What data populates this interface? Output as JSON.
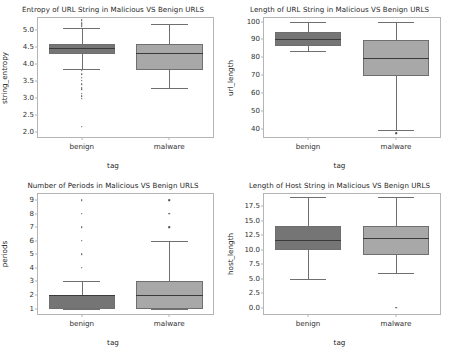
{
  "figure": {
    "background": "#ffffff",
    "benign_color": "#757575",
    "malware_color": "#a8a8a8",
    "edge_color": "#6f6f6f"
  },
  "chart_data": [
    {
      "id": "entropy",
      "type": "box",
      "title": "Entropy of URL String in Malicious VS Benign URLS",
      "xlabel": "tag",
      "ylabel": "string_entropy",
      "categories": [
        "benign",
        "malware"
      ],
      "yticks": [
        2.0,
        2.5,
        3.0,
        3.5,
        4.0,
        4.5,
        5.0
      ],
      "ytick_labels": [
        "2.0",
        "2.5",
        "3.0",
        "3.5",
        "4.0",
        "4.5",
        "5.0"
      ],
      "ylim": [
        1.85,
        5.35
      ],
      "grid": false,
      "boxes": [
        {
          "name": "benign",
          "color": "#757575",
          "whislo": 3.86,
          "q1": 4.28,
          "med": 4.46,
          "q3": 4.6,
          "whishi": 5.07,
          "fliers": [
            5.28,
            5.2,
            5.15,
            5.12,
            5.09,
            3.8,
            3.7,
            3.6,
            3.5,
            3.4,
            3.3,
            3.25,
            3.12,
            3.05,
            2.98,
            2.15
          ]
        },
        {
          "name": "malware",
          "color": "#a8a8a8",
          "whislo": 3.28,
          "q1": 3.83,
          "med": 4.32,
          "q3": 4.58,
          "whishi": 5.18,
          "fliers": []
        }
      ]
    },
    {
      "id": "url_length",
      "type": "box",
      "title": "Length of URL String in Malicious VS Benign URLS",
      "xlabel": "tag",
      "ylabel": "url_length",
      "categories": [
        "benign",
        "malware"
      ],
      "yticks": [
        40,
        50,
        60,
        70,
        80,
        90,
        100
      ],
      "ytick_labels": [
        "40",
        "50",
        "60",
        "70",
        "80",
        "90",
        "100"
      ],
      "ylim": [
        35.5,
        102
      ],
      "grid": false,
      "boxes": [
        {
          "name": "benign",
          "color": "#757575",
          "whislo": 83.5,
          "q1": 86.5,
          "med": 90.5,
          "q3": 94.0,
          "whishi": 99.5,
          "fliers": []
        },
        {
          "name": "malware",
          "color": "#a8a8a8",
          "whislo": 39.5,
          "q1": 69.8,
          "med": 79.5,
          "q3": 89.8,
          "whishi": 99.5,
          "fliers": [
            37.5
          ]
        }
      ]
    },
    {
      "id": "periods",
      "type": "box",
      "title": "Number of Periods in Malicious VS Benign URLS",
      "xlabel": "tag",
      "ylabel": "periods",
      "categories": [
        "benign",
        "malware"
      ],
      "yticks": [
        1,
        2,
        3,
        4,
        5,
        6,
        7,
        8,
        9
      ],
      "ytick_labels": [
        "1",
        "2",
        "3",
        "4",
        "5",
        "6",
        "7",
        "8",
        "9"
      ],
      "ylim": [
        0.6,
        9.45
      ],
      "grid": false,
      "boxes": [
        {
          "name": "benign",
          "color": "#757575",
          "whislo": 1.0,
          "q1": 1.0,
          "med": 2.0,
          "q3": 2.0,
          "whishi": 3.0,
          "fliers": [
            4,
            5,
            6,
            7,
            8,
            9
          ]
        },
        {
          "name": "malware",
          "color": "#a8a8a8",
          "whislo": 1.0,
          "q1": 1.0,
          "med": 2.0,
          "q3": 3.0,
          "whishi": 6.0,
          "fliers": [
            7,
            8,
            9
          ]
        }
      ]
    },
    {
      "id": "host_length",
      "type": "box",
      "title": "Length of Host String in Malicious VS Benign URLS",
      "xlabel": "tag",
      "ylabel": "host_length",
      "categories": [
        "benign",
        "malware"
      ],
      "yticks": [
        0.0,
        2.5,
        5.0,
        7.5,
        10.0,
        12.5,
        15.0,
        17.5
      ],
      "ytick_labels": [
        "0.0",
        "2.5",
        "5.0",
        "7.5",
        "10.0",
        "12.5",
        "15.0",
        "17.5"
      ],
      "ylim": [
        -1.1,
        19.6
      ],
      "grid": false,
      "boxes": [
        {
          "name": "benign",
          "color": "#757575",
          "whislo": 5.0,
          "q1": 10.0,
          "med": 11.6,
          "q3": 14.0,
          "whishi": 19.0,
          "fliers": []
        },
        {
          "name": "malware",
          "color": "#a8a8a8",
          "whislo": 6.0,
          "q1": 9.1,
          "med": 12.0,
          "q3": 14.0,
          "whishi": 19.0,
          "fliers": [
            0.0
          ]
        }
      ]
    }
  ]
}
